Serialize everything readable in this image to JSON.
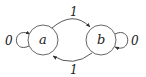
{
  "diagram": {
    "type": "finite-state-machine",
    "states": [
      {
        "id": "a",
        "label": "a"
      },
      {
        "id": "b",
        "label": "b"
      }
    ],
    "transitions": [
      {
        "from": "a",
        "to": "a",
        "label": "0"
      },
      {
        "from": "a",
        "to": "b",
        "label": "1"
      },
      {
        "from": "b",
        "to": "a",
        "label": "1"
      },
      {
        "from": "b",
        "to": "b",
        "label": "0"
      }
    ],
    "colors": {
      "stroke": "#444444",
      "background": "#ffffff",
      "text": "#222222"
    }
  }
}
